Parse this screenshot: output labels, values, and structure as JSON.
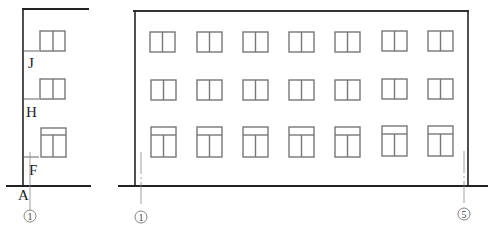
{
  "drawing": {
    "type": "architectural-elevation",
    "side_elevation": {
      "floor_labels": [
        "J",
        "H",
        "F",
        "A"
      ],
      "axis_label": "1"
    },
    "front_elevation": {
      "window_columns": 7,
      "window_rows": 3,
      "axis_labels": [
        "1",
        "5"
      ]
    },
    "colors": {
      "line": "#222222",
      "window": "#777777",
      "axis": "#888888",
      "background": "#ffffff"
    }
  }
}
